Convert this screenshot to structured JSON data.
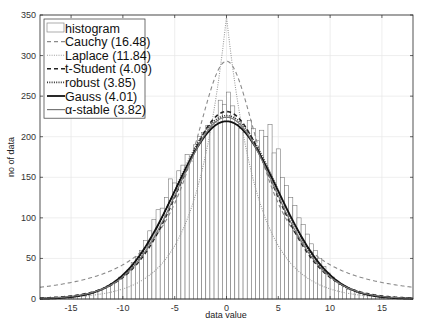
{
  "chart_data": {
    "type": "bar",
    "title": "",
    "xlabel": "data value",
    "ylabel": "no of data",
    "xlim": [
      -18,
      18
    ],
    "ylim": [
      0,
      350
    ],
    "xticks": [
      -15,
      -10,
      -5,
      0,
      5,
      10,
      15
    ],
    "yticks": [
      0,
      50,
      100,
      150,
      200,
      250,
      300,
      350
    ],
    "grid": true,
    "legend_position": "upper-left",
    "histogram": {
      "name": "histogram",
      "bin_width": 0.4,
      "centers": [
        -17.8,
        -17.4,
        -17.0,
        -16.6,
        -16.2,
        -15.8,
        -15.4,
        -15.0,
        -14.6,
        -14.2,
        -13.8,
        -13.4,
        -13.0,
        -12.6,
        -12.2,
        -11.8,
        -11.4,
        -11.0,
        -10.6,
        -10.2,
        -9.8,
        -9.4,
        -9.0,
        -8.6,
        -8.2,
        -7.8,
        -7.4,
        -7.0,
        -6.6,
        -6.2,
        -5.8,
        -5.4,
        -5.0,
        -4.6,
        -4.2,
        -3.8,
        -3.4,
        -3.0,
        -2.6,
        -2.2,
        -1.8,
        -1.4,
        -1.0,
        -0.6,
        -0.2,
        0.2,
        0.6,
        1.0,
        1.4,
        1.8,
        2.2,
        2.6,
        3.0,
        3.4,
        3.8,
        4.2,
        4.6,
        5.0,
        5.4,
        5.8,
        6.2,
        6.6,
        7.0,
        7.4,
        7.8,
        8.2,
        8.6,
        9.0,
        9.4,
        9.8,
        10.2,
        10.6,
        11.0,
        11.4,
        11.8,
        12.2,
        12.6,
        13.0,
        13.4,
        13.8,
        14.2,
        14.6,
        15.0,
        15.4,
        15.8,
        16.2,
        16.6,
        17.0,
        17.4,
        17.8
      ],
      "counts": [
        1,
        1,
        1,
        2,
        1,
        2,
        2,
        3,
        3,
        4,
        5,
        6,
        7,
        9,
        11,
        13,
        16,
        19,
        22,
        27,
        30,
        36,
        45,
        52,
        60,
        72,
        84,
        98,
        110,
        112,
        125,
        148,
        143,
        158,
        165,
        178,
        170,
        190,
        200,
        205,
        214,
        212,
        218,
        245,
        240,
        255,
        238,
        215,
        210,
        205,
        220,
        210,
        195,
        208,
        200,
        215,
        180,
        185,
        150,
        140,
        125,
        115,
        100,
        92,
        80,
        68,
        60,
        50,
        40,
        32,
        27,
        22,
        18,
        15,
        12,
        11,
        9,
        7,
        6,
        5,
        4,
        3,
        3,
        2,
        2,
        2,
        1,
        1,
        1,
        1
      ]
    },
    "series": [
      {
        "name": "Cauchy (16.48)",
        "dist": "cauchy",
        "params": {
          "mu": 0,
          "gamma": 4.1,
          "peak": 293
        },
        "style": "dashed",
        "color": "#8a8a8a",
        "width": 1.1
      },
      {
        "name": "Laplace (11.84)",
        "dist": "laplace",
        "params": {
          "mu": 0,
          "b": 3.0,
          "peak": 348
        },
        "style": "dotted",
        "color": "#9a9a9a",
        "width": 1.1
      },
      {
        "name": "t-Student (4.09)",
        "dist": "tstudent",
        "params": {
          "mu": 0,
          "sigma": 4.6,
          "nu": 12,
          "peak": 231
        },
        "style": "dashed",
        "color": "#222222",
        "width": 1.6
      },
      {
        "name": "robust (3.85)",
        "dist": "gauss",
        "params": {
          "mu": 0,
          "sigma": 4.85,
          "peak": 226,
          "tail": 3
        },
        "style": "dotted",
        "color": "#333333",
        "width": 1.6
      },
      {
        "name": "Gauss (4.01)",
        "dist": "gauss",
        "params": {
          "mu": 0,
          "sigma": 5.0,
          "peak": 219,
          "tail": 0
        },
        "style": "solid",
        "color": "#111111",
        "width": 1.8
      },
      {
        "name": "α-stable (3.82)",
        "dist": "tstudent",
        "params": {
          "mu": 0,
          "sigma": 4.75,
          "nu": 20,
          "peak": 224
        },
        "style": "solid",
        "color": "#777777",
        "width": 1.2
      }
    ],
    "legend": [
      "histogram",
      "Cauchy (16.48)",
      "Laplace (11.84)",
      "t-Student (4.09)",
      "robust (3.85)",
      "Gauss (4.01)",
      "α-stable (3.82)"
    ]
  }
}
